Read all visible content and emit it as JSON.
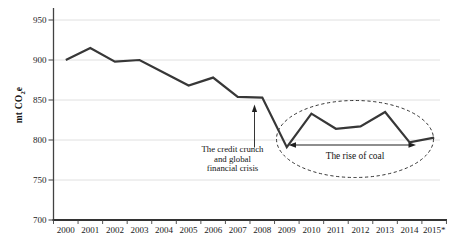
{
  "chart_data": {
    "type": "line",
    "title": "",
    "categories": [
      "2000",
      "2001",
      "2002",
      "2003",
      "2004",
      "2005",
      "2006",
      "2007",
      "2008",
      "2009",
      "2010",
      "2011",
      "2012",
      "2013",
      "2014",
      "2015*"
    ],
    "values": [
      900,
      915,
      898,
      900,
      884,
      868,
      878,
      854,
      853,
      791,
      833,
      814,
      817,
      835,
      797,
      803
    ],
    "ylabel_parts": {
      "pre": "mt CO",
      "sub": "2",
      "post": "e"
    },
    "y_ticks": [
      700,
      750,
      800,
      850,
      900,
      950
    ],
    "ylim": [
      700,
      965
    ],
    "grid": "horizontal",
    "legend": "none",
    "annotations": {
      "credit_crunch": {
        "lines": [
          "The credit crunch",
          "and global",
          "financial crisis"
        ]
      },
      "rise_of_coal": {
        "label": "The rise of coal"
      }
    },
    "colors": {
      "line": "#373737",
      "grid": "#e0e0e0",
      "axis": "#424242",
      "text": "#1b1b1b",
      "annotation": "#1f1f1f"
    }
  }
}
